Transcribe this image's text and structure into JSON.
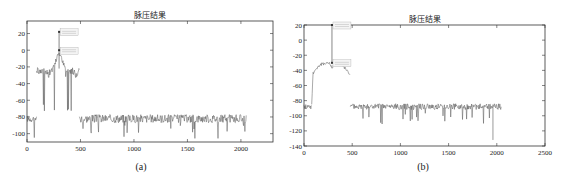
{
  "chart_data": [
    {
      "id": "a",
      "type": "line",
      "title": "脉压结果",
      "caption": "(a)",
      "xlabel": "",
      "ylabel": "",
      "xlim": [
        0,
        2300
      ],
      "ylim": [
        -110,
        35
      ],
      "xticks": [
        0,
        500,
        1000,
        1500,
        2000
      ],
      "yticks": [
        20,
        0,
        -20,
        -40,
        -60,
        -80,
        -100
      ],
      "grid": false,
      "segments": [
        {
          "name": "noise-left",
          "x": [
            0,
            90
          ],
          "level": -82,
          "spread": 8
        },
        {
          "name": "sidelobes",
          "x": [
            90,
            490
          ],
          "level": -22,
          "spread": 10
        },
        {
          "name": "noise-right",
          "x": [
            490,
            2050
          ],
          "level": -82,
          "spread": 10
        }
      ],
      "peaks": [
        {
          "x": 300,
          "y": 22,
          "label": "data-tip-1"
        },
        {
          "x": 300,
          "y": 0,
          "label": "data-tip-2"
        }
      ],
      "plot_box": {
        "left": 27,
        "top": 21,
        "right": 273,
        "bottom": 142
      }
    },
    {
      "id": "b",
      "type": "line",
      "title": "脉压结果",
      "caption": "(b)",
      "xlabel": "",
      "ylabel": "",
      "xlim": [
        0,
        2500
      ],
      "ylim": [
        -140,
        20
      ],
      "xticks": [
        0,
        500,
        1000,
        1500,
        2000,
        2500
      ],
      "yticks": [
        20,
        0,
        -20,
        -40,
        -60,
        -80,
        -100,
        -120,
        -140
      ],
      "grid": false,
      "segments": [
        {
          "name": "noise-left",
          "x": [
            0,
            80
          ],
          "level": -88,
          "spread": 7
        },
        {
          "name": "arch",
          "x": [
            80,
            480
          ],
          "level": -30,
          "spread": 4
        },
        {
          "name": "noise-right",
          "x": [
            480,
            2050
          ],
          "level": -88,
          "spread": 8
        }
      ],
      "peaks": [
        {
          "x": 290,
          "y": 20,
          "label": "data-tip-1"
        },
        {
          "x": 290,
          "y": -30,
          "label": "data-tip-2"
        }
      ],
      "dips": [
        {
          "x": 1960,
          "y": -132
        }
      ],
      "plot_box": {
        "left": 22,
        "top": 25,
        "right": 263,
        "bottom": 146
      }
    }
  ],
  "colors": {
    "axis": "#333333",
    "signal": "#555555",
    "tick_label": "#222222",
    "data_tip_bg": "#f4f4f4"
  }
}
